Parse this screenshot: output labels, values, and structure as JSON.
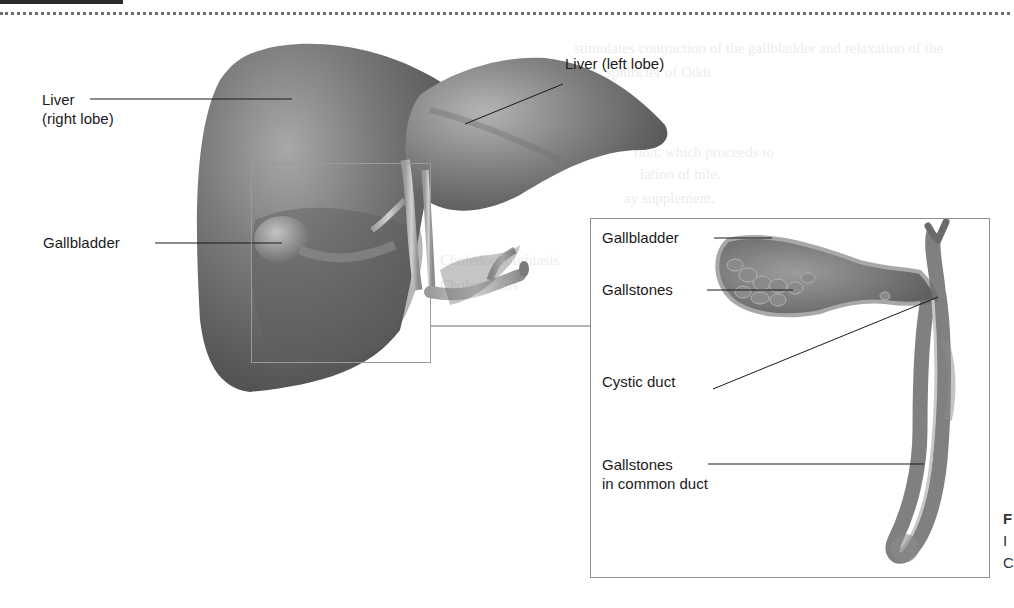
{
  "figure": {
    "main_labels": {
      "liver_right_lobe_line1": "Liver",
      "liver_right_lobe_line2": "(right lobe)",
      "liver_left_lobe": "Liver (left lobe)",
      "gallbladder": "Gallbladder"
    },
    "inset_labels": {
      "gallbladder": "Gallbladder",
      "gallstones": "Gallstones",
      "cystic_duct": "Cystic duct",
      "gallstones_common_duct_line1": "Gallstones",
      "gallstones_common_duct_line2": "in common duct"
    },
    "edge_caption": [
      "F",
      "I",
      "C"
    ]
  },
  "colors": {
    "liver": "#6b6b6b",
    "liver_highlight": "#9a9a9a",
    "duct": "#b9b9b9",
    "box_border": "#8f8f8f",
    "label_text": "#1a1a1a"
  },
  "background_text": [
    "stimulates contraction of the gallbladder and relaxation of the",
    "sphincter of Oddi",
    "sphincter of Oddi",
    "tion, which proceeds to",
    "lation of bile.",
    "ay supplement,",
    "Common",
    "Choledocholithiasis",
    "Cholecystitis"
  ]
}
